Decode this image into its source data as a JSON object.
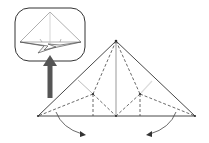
{
  "diagram": {
    "type": "origami-step",
    "colors": {
      "line": "#333333",
      "dashed": "#444444",
      "inset_border": "#333333",
      "inset_line": "#9a9a9a",
      "arrow": "#555555",
      "highlight": "#e0e0e0",
      "background": "#ffffff"
    },
    "inset": {
      "label": "result-preview"
    },
    "main": {
      "label": "folding-step"
    },
    "arrows": [
      {
        "name": "fold-left-flap-arrow",
        "direction": "down-right"
      },
      {
        "name": "fold-right-flap-arrow",
        "direction": "down-left"
      },
      {
        "name": "result-indicator-arrow",
        "direction": "up"
      }
    ]
  }
}
